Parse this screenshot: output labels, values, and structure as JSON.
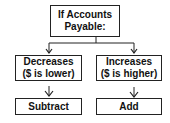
{
  "diagram": {
    "root": {
      "line1": "If Accounts",
      "line2": "Payable:"
    },
    "branches": [
      {
        "condition_line1": "Decreases",
        "condition_line2": "($ is lower)",
        "action": "Subtract"
      },
      {
        "condition_line1": "Increases",
        "condition_line2": "($ is higher)",
        "action": "Add"
      }
    ],
    "colors": {
      "stroke": "#222222",
      "fill": "#ffffff",
      "text": "#111111"
    }
  }
}
